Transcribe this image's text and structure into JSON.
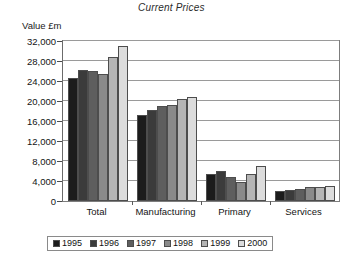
{
  "chart_data": {
    "type": "bar",
    "title": "Current Prices",
    "xlabel": "",
    "ylabel": "Value £m",
    "ylim": [
      0,
      32000
    ],
    "ytick_values": [
      0,
      4000,
      8000,
      12000,
      16000,
      20000,
      24000,
      28000,
      32000
    ],
    "ytick_labels": [
      "0",
      "4,000",
      "8,000",
      "12,000",
      "16,000",
      "20,000",
      "24,000",
      "28,000",
      "32,000"
    ],
    "grid": true,
    "legend_position": "bottom",
    "categories": [
      "Total",
      "Manufacturing",
      "Primary",
      "Services"
    ],
    "series": [
      {
        "name": "1995",
        "color": "#1c1c1c",
        "values": [
          24700,
          17200,
          5500,
          2050
        ]
      },
      {
        "name": "1996",
        "color": "#3b3b3b",
        "values": [
          26300,
          18200,
          6000,
          2300
        ]
      },
      {
        "name": "1997",
        "color": "#5e5e5e",
        "values": [
          26000,
          19100,
          4800,
          2450
        ]
      },
      {
        "name": "1998",
        "color": "#8a8a8a",
        "values": [
          25400,
          19200,
          3900,
          2750
        ]
      },
      {
        "name": "1999",
        "color": "#b5b5b5",
        "values": [
          28900,
          20400,
          5500,
          2800
        ]
      },
      {
        "name": "2000",
        "color": "#dcdcdc",
        "values": [
          31000,
          20900,
          7000,
          2950
        ]
      }
    ]
  }
}
